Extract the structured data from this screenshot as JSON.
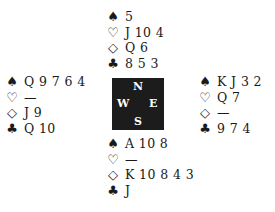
{
  "diagram": {
    "type": "bridge-deal",
    "suit_symbols": {
      "spades": "♠",
      "hearts": "♡",
      "diamonds": "◇",
      "clubs": "♣"
    },
    "compass": {
      "north": "N",
      "south": "S",
      "west": "W",
      "east": "E"
    },
    "hands": {
      "north": {
        "spades": "5",
        "hearts": "J 10 4",
        "diamonds": "Q 6",
        "clubs": "8 5 3"
      },
      "west": {
        "spades": "Q 9 7 6 4",
        "hearts": "—",
        "diamonds": "J 9",
        "clubs": "Q 10"
      },
      "east": {
        "spades": "K J 3 2",
        "hearts": "Q 7",
        "diamonds": "—",
        "clubs": "9 7 4"
      },
      "south": {
        "spades": "A 10 8",
        "hearts": "—",
        "diamonds": "K 10 8 4 3",
        "clubs": "J"
      }
    }
  }
}
